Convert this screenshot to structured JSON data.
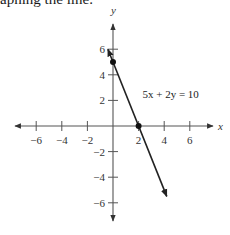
{
  "caption": "aphing the line.",
  "chart_data": {
    "type": "line",
    "title": "",
    "xlabel": "x",
    "ylabel": "y",
    "xlim": [
      -7,
      7.5
    ],
    "ylim": [
      -7.5,
      7
    ],
    "x_ticks": [
      -6,
      -4,
      -2,
      2,
      4,
      6
    ],
    "y_ticks": [
      6,
      4,
      2,
      -2,
      -4,
      -6
    ],
    "x_tick_labels": [
      "−6",
      "−4",
      "−2",
      "2",
      "4",
      "6"
    ],
    "y_tick_labels": [
      "6",
      "4",
      "2",
      "−2",
      "−4",
      "−6"
    ],
    "grid": false,
    "series": [
      {
        "name": "5x + 2y = 10",
        "equation": "5x + 2y = 10",
        "slope": -2.5,
        "y_intercept": 5,
        "x_intercept": 2,
        "x": [
          -0.4,
          4.2
        ],
        "y": [
          6.0,
          -5.5
        ]
      }
    ],
    "points": [
      {
        "x": 0,
        "y": 5,
        "label": "y-intercept"
      },
      {
        "x": 2,
        "y": 0,
        "label": "x-intercept"
      }
    ],
    "annotations": [
      {
        "text": "5x + 2y = 10",
        "x": 2.3,
        "y": 2.5
      }
    ]
  }
}
